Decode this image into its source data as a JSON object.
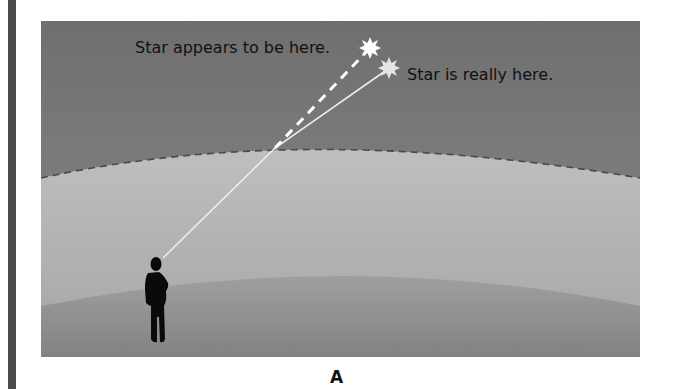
{
  "diagram": {
    "labels": {
      "apparent_star": "Star appears to be here.",
      "real_star": "Star is really here.",
      "figure_label": "A"
    },
    "elements": {
      "apparent_star": {
        "icon": "star-burst-icon",
        "color": "#ffffff"
      },
      "real_star": {
        "icon": "star-burst-icon",
        "color": "#e6e6e6"
      },
      "observer": {
        "icon": "person-silhouette-icon",
        "color": "#0a0a0a"
      },
      "atmosphere_boundary": {
        "style": "dashed",
        "color": "#4a4a4a"
      },
      "true_light_path": {
        "style": "solid",
        "color": "#e8e8e8"
      },
      "apparent_line_of_sight": {
        "style": "dashed",
        "color": "#ffffff"
      }
    },
    "colors": {
      "space": "#7a7a7a",
      "atmosphere_top": "#bdbdbd",
      "atmosphere_bottom": "#a9a9a9",
      "ground_top": "#9a9a9a",
      "ground_bottom": "#858585",
      "left_bar": "#4a4a4a"
    }
  }
}
